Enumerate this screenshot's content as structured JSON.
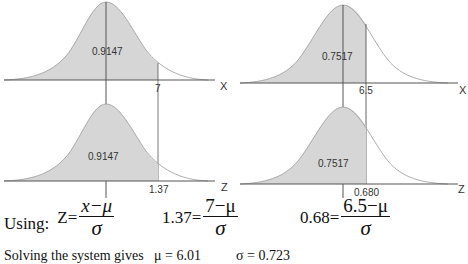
{
  "panels": [
    {
      "id": "top-left",
      "area_label": "0.9147",
      "cutoff_label": "7",
      "axis_label": "X"
    },
    {
      "id": "bottom-left",
      "area_label": "0.9147",
      "cutoff_label": "1.37",
      "axis_label": "Z"
    },
    {
      "id": "top-right",
      "area_label": "0.7517",
      "cutoff_label": "6.5",
      "axis_label": "X"
    },
    {
      "id": "bottom-right",
      "area_label": "0.7517",
      "cutoff_label": "0.680",
      "axis_label": "Z"
    }
  ],
  "formulas": {
    "using_label": "Using:",
    "general": {
      "lhs": "Z",
      "eq": "=",
      "numerator": "x−μ",
      "denominator": "σ"
    },
    "eq1": {
      "lhs": "1.37",
      "eq": "=",
      "numerator": "7−μ",
      "denominator": "σ"
    },
    "eq2": {
      "lhs": "0.68",
      "eq": "=",
      "numerator": "6.5−μ",
      "denominator": "σ"
    }
  },
  "footer_text": "Solving the system gives   μ = 6.01          σ = 0.723",
  "colors": {
    "shade": "#d6d6d6",
    "line": "#555555",
    "curve": "#999999"
  }
}
